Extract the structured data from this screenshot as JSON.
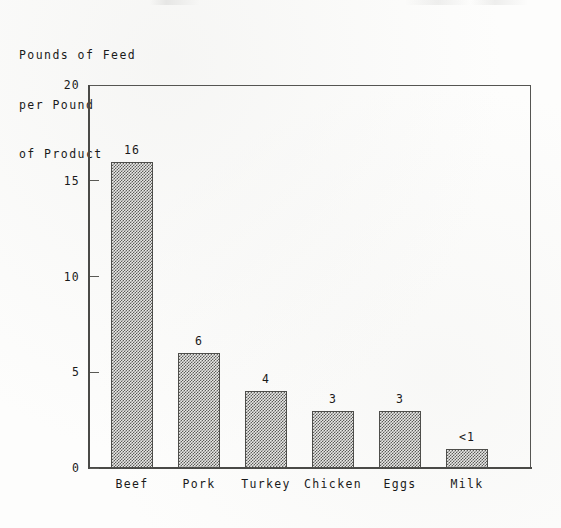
{
  "axis_caption": {
    "line1": "Pounds of Feed",
    "line2": "per Pound",
    "line3": "of Product"
  },
  "chart_data": {
    "type": "bar",
    "title": "",
    "subtitle": "",
    "xlabel": "",
    "ylabel": "Pounds of Feed per Pound of Product",
    "ylim": [
      0,
      20
    ],
    "yticks": [
      0,
      5,
      10,
      15,
      20
    ],
    "ytick_labels": [
      "0",
      "5",
      "10",
      "15",
      "20"
    ],
    "grid": false,
    "legend": false,
    "categories": [
      "Beef",
      "Pork",
      "Turkey",
      "Chicken",
      "Eggs",
      "Milk"
    ],
    "values": [
      16,
      6,
      4,
      3,
      3,
      1
    ],
    "value_labels": [
      "16",
      "6",
      "4",
      "3",
      "3",
      "<1"
    ],
    "bar_fill": "#5c5c59",
    "bar_edge": "#4e4e4b",
    "axis_color": "#4a4a47",
    "background": "#fdfdfc"
  }
}
